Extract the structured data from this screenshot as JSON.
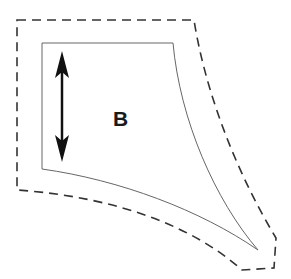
{
  "diagram": {
    "piece_label": "B",
    "grainline": "double-headed vertical arrow",
    "colors": {
      "cut_line": "#333333",
      "seam_line": "#666666",
      "arrow": "#111111",
      "background": "#ffffff"
    }
  }
}
